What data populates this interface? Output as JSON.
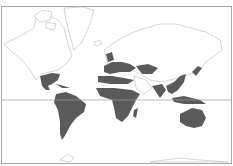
{
  "map": {
    "type": "world distribution map",
    "projection": "Mercator",
    "colors": {
      "background": "#ffffff",
      "land_outline": "#b8b8b8",
      "shaded_region": "#5a5a5a",
      "frame": "#a8a8a8",
      "equator": "#9a9a9a"
    },
    "features": {
      "equator_line": true,
      "frame_border": true
    },
    "shaded_regions": [
      "Mexico and Central America",
      "Caribbean islands",
      "South America",
      "Western and Southern Europe",
      "British Isles",
      "Central Asia / Caspian region",
      "North Africa coast",
      "Sub-Saharan Africa",
      "Madagascar",
      "Indian subcontinent",
      "Southeast Asia and southern China",
      "Japan",
      "Indonesia and New Guinea",
      "Australia"
    ]
  }
}
